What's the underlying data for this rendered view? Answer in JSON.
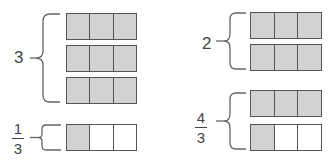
{
  "diagram": {
    "colors": {
      "shaded": "#d2d2d2",
      "unshaded": "#ffffff",
      "outline": "#555555",
      "text": "#444444"
    },
    "groups": [
      {
        "id": "three",
        "label": "3",
        "bars": [
          {
            "cells": 3,
            "shaded": 3
          },
          {
            "cells": 3,
            "shaded": 3
          },
          {
            "cells": 3,
            "shaded": 3
          }
        ]
      },
      {
        "id": "one-third",
        "label_numerator": "1",
        "label_denominator": "3",
        "bars": [
          {
            "cells": 3,
            "shaded": 1
          }
        ]
      },
      {
        "id": "two",
        "label": "2",
        "bars": [
          {
            "cells": 3,
            "shaded": 3
          },
          {
            "cells": 3,
            "shaded": 3
          }
        ]
      },
      {
        "id": "four-thirds",
        "label_numerator": "4",
        "label_denominator": "3",
        "bars": [
          {
            "cells": 3,
            "shaded": 3
          },
          {
            "cells": 3,
            "shaded": 1
          }
        ]
      }
    ]
  }
}
